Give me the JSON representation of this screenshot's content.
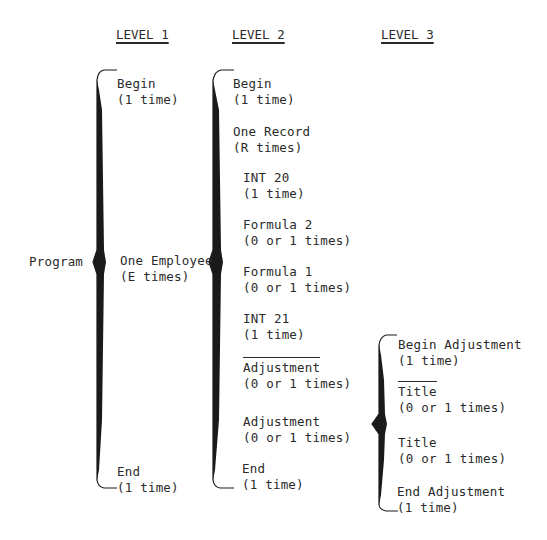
{
  "headers": {
    "level1": "LEVEL 1",
    "level2": "LEVEL 2",
    "level3": "LEVEL 3"
  },
  "root": {
    "label": "Program"
  },
  "level1": {
    "items": [
      {
        "name": "Begin",
        "count": "(1 time)"
      },
      {
        "name": "One Employee",
        "count": "(E times)"
      },
      {
        "name": "End",
        "count": "(1 time)"
      }
    ]
  },
  "level2": {
    "items": [
      {
        "name": "Begin",
        "count": "(1 time)"
      },
      {
        "name": "One Record",
        "count": "(R times)"
      },
      {
        "name": "INT 20",
        "count": "(1 time)"
      },
      {
        "name": "Formula 2",
        "count": "(0 or 1 times)"
      },
      {
        "name": "Formula 1",
        "count": "(0 or 1 times)"
      },
      {
        "name": "INT 21",
        "count": "(1 time)"
      },
      {
        "name": "Adjustment",
        "count": "(0 or 1 times)",
        "overline": true
      },
      {
        "name": "Adjustment",
        "count": "(0 or 1 times)"
      },
      {
        "name": "End",
        "count": "(1 time)"
      }
    ]
  },
  "level3": {
    "items": [
      {
        "name": "Begin Adjustment",
        "count": "(1 time)"
      },
      {
        "name": "Title",
        "count": "(0 or 1 times)",
        "overline": true
      },
      {
        "name": "Title",
        "count": "(0 or 1 times)"
      },
      {
        "name": "End Adjustment",
        "count": "(1 time)"
      }
    ]
  },
  "colors": {
    "ink": "#2a2a2a",
    "background": "#ffffff"
  }
}
